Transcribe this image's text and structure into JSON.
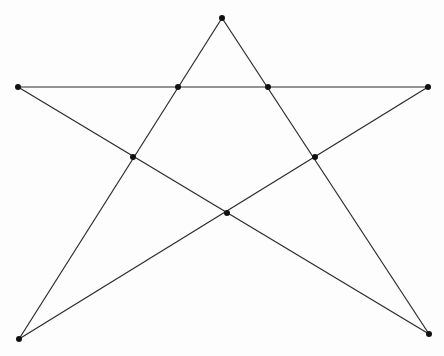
{
  "diagram": {
    "type": "pentagram",
    "width": 444,
    "height": 356,
    "colors": {
      "background": "#fdfdfd",
      "line": "#2a2a2a",
      "point": "#111111"
    },
    "point_radius": 3,
    "outer_points": [
      {
        "id": "top",
        "x": 222,
        "y": 18
      },
      {
        "id": "left",
        "x": 18,
        "y": 87
      },
      {
        "id": "right",
        "x": 428,
        "y": 87
      },
      {
        "id": "bottom-left",
        "x": 19,
        "y": 339
      },
      {
        "id": "bottom-right",
        "x": 429,
        "y": 334
      }
    ],
    "inner_points": [
      {
        "id": "inner-top-left",
        "x": 178,
        "y": 87
      },
      {
        "id": "inner-top-right",
        "x": 268,
        "y": 87
      },
      {
        "id": "inner-mid-left",
        "x": 133,
        "y": 157
      },
      {
        "id": "inner-mid-right",
        "x": 315,
        "y": 157
      },
      {
        "id": "inner-bottom",
        "x": 227,
        "y": 213
      }
    ],
    "segments": [
      {
        "from": "top",
        "to": "bottom-left"
      },
      {
        "from": "top",
        "to": "bottom-right"
      },
      {
        "from": "left",
        "to": "right"
      },
      {
        "from": "left",
        "to": "bottom-right"
      },
      {
        "from": "right",
        "to": "bottom-left"
      }
    ]
  }
}
